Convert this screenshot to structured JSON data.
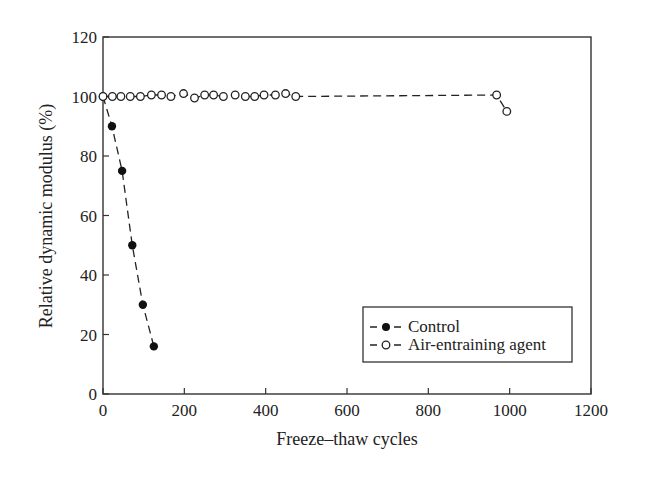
{
  "chart_data": {
    "type": "line",
    "title": "",
    "xlabel": "Freeze–thaw cycles",
    "ylabel": "Relative dynamic modulus (%)",
    "xlim": [
      0,
      1200
    ],
    "ylim": [
      0,
      120
    ],
    "xticks": [
      0,
      200,
      400,
      600,
      800,
      1000,
      1200
    ],
    "yticks": [
      0,
      20,
      40,
      60,
      80,
      100,
      120
    ],
    "grid": false,
    "legend_position": "lower right",
    "series": [
      {
        "name": "Control",
        "marker": "filled-circle",
        "line": "dashed",
        "x": [
          0,
          22,
          47,
          72,
          98,
          125
        ],
        "y": [
          100,
          90,
          75,
          50,
          30,
          16
        ]
      },
      {
        "name": "Air-entraining agent",
        "marker": "open-circle",
        "line": "dashed",
        "x": [
          0,
          23,
          44,
          67,
          92,
          119,
          144,
          167,
          198,
          225,
          250,
          272,
          296,
          325,
          350,
          373,
          396,
          424,
          449,
          474,
          968,
          993
        ],
        "y": [
          100,
          100,
          100,
          100,
          100,
          100.5,
          100.5,
          100,
          101,
          99.5,
          100.5,
          100.5,
          100,
          100.5,
          100,
          100,
          100.5,
          100.5,
          101,
          100,
          100.5,
          95
        ]
      }
    ]
  }
}
